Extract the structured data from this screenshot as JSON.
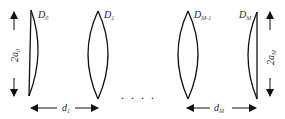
{
  "diagram": {
    "type": "lens-sequence",
    "lenses": [
      {
        "id": "D0",
        "label": "D",
        "subscript": "0",
        "shape": "plano-convex (flat left)"
      },
      {
        "id": "D1",
        "label": "D",
        "subscript": "1",
        "shape": "biconvex"
      },
      {
        "id": "DM-1",
        "label": "D",
        "subscript": "M-1",
        "shape": "biconvex"
      },
      {
        "id": "DM",
        "label": "D",
        "subscript": "M",
        "shape": "plano-convex (flat right)"
      }
    ],
    "apertures": [
      {
        "label": "2a",
        "subscript": "0",
        "side": "left"
      },
      {
        "label": "2a",
        "subscript": "M",
        "side": "right"
      }
    ],
    "distances": [
      {
        "label": "d",
        "subscript": "1"
      },
      {
        "label": "d",
        "subscript": "M"
      }
    ],
    "ellipsis": ". . . ."
  }
}
